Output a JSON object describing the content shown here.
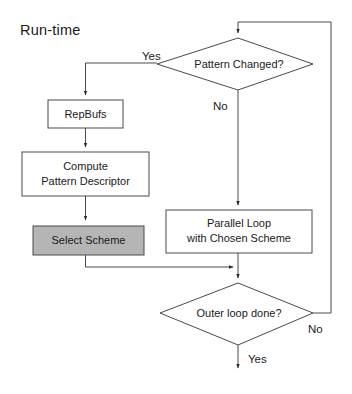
{
  "diagram": {
    "title": "Run-time",
    "type": "flowchart",
    "nodes": [
      {
        "id": "pattern-changed",
        "shape": "decision",
        "label": "Pattern Changed?",
        "lines": [
          "Pattern Changed?"
        ]
      },
      {
        "id": "repbufs",
        "shape": "process",
        "label": "RepBufs",
        "lines": [
          "RepBufs"
        ]
      },
      {
        "id": "compute-pattern-descriptor",
        "shape": "process",
        "label": "Compute Pattern Descriptor",
        "lines": [
          "Compute",
          "Pattern Descriptor"
        ]
      },
      {
        "id": "select-scheme",
        "shape": "process",
        "label": "Select Scheme",
        "lines": [
          "Select Scheme"
        ],
        "fill": "#b5b5b5"
      },
      {
        "id": "parallel-loop",
        "shape": "process",
        "label": "Parallel Loop with Chosen Scheme",
        "lines": [
          "Parallel Loop",
          "with Chosen Scheme"
        ]
      },
      {
        "id": "outer-loop-done",
        "shape": "decision",
        "label": "Outer loop done?",
        "lines": [
          "Outer loop done?"
        ]
      }
    ],
    "edge_labels": {
      "pattern_yes": "Yes",
      "pattern_no": "No",
      "outer_no": "No",
      "outer_yes": "Yes"
    },
    "colors": {
      "stroke": "#4a4a4a",
      "text": "#1a1a1a",
      "shaded_fill": "#b5b5b5",
      "node_fill": "#ffffff",
      "background": "#ffffff"
    }
  }
}
